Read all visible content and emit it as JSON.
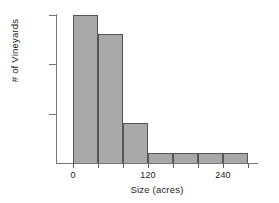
{
  "chart_data": {
    "type": "bar",
    "title": "",
    "subtitle": "",
    "xlabel": "Size (acres)",
    "ylabel": "# of Vineyards",
    "grid": false,
    "legend": "none",
    "bin_width": 40,
    "bin_edges": [
      0,
      40,
      80,
      120,
      160,
      200,
      240,
      280
    ],
    "categories": [
      "0-40",
      "40-80",
      "80-120",
      "120-160",
      "160-200",
      "200-240",
      "240-280"
    ],
    "values": [
      15,
      13,
      4,
      1,
      1,
      1,
      1
    ],
    "bars": [
      {
        "label": "0-40",
        "x0": 0,
        "x1": 40,
        "value": 15
      },
      {
        "label": "40-80",
        "x0": 40,
        "x1": 80,
        "value": 13
      },
      {
        "label": "80-120",
        "x0": 80,
        "x1": 120,
        "value": 4
      },
      {
        "label": "120-160",
        "x0": 120,
        "x1": 160,
        "value": 1
      },
      {
        "label": "160-200",
        "x0": 160,
        "x1": 200,
        "value": 1
      },
      {
        "label": "200-240",
        "x0": 200,
        "x1": 240,
        "value": 1
      },
      {
        "label": "240-280",
        "x0": 240,
        "x1": 280,
        "value": 1
      }
    ],
    "xlim": [
      -20,
      300
    ],
    "ylim": [
      0,
      16
    ],
    "x_ticks": [
      0,
      40,
      80,
      120,
      160,
      200,
      240,
      280
    ],
    "x_tick_labels": [
      "0",
      "",
      "",
      "120",
      "",
      "",
      "240",
      ""
    ],
    "y_ticks": [
      5,
      10,
      15
    ],
    "y_tick_labels": [
      "5",
      "10",
      "15"
    ],
    "colors": {
      "bar_fill": "#a8a8a8",
      "bar_edge": "#555555",
      "axis": "#767676",
      "text": "#1d1d1d",
      "background": "#ffffff"
    }
  }
}
